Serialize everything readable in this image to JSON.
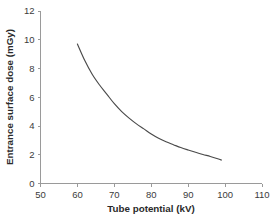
{
  "chart_data": {
    "type": "line",
    "title": "",
    "xlabel": "Tube potential (kV)",
    "ylabel": "Entrance surface dose (mGy)",
    "xlim": [
      50,
      110
    ],
    "ylim": [
      0,
      12
    ],
    "xticks": [
      50,
      60,
      70,
      80,
      90,
      100,
      110
    ],
    "yticks": [
      0,
      2,
      4,
      6,
      8,
      10,
      12
    ],
    "xtick_labels": [
      "50",
      "60",
      "70",
      "80",
      "90",
      "100",
      "110"
    ],
    "ytick_labels": [
      "0",
      "2",
      "4",
      "6",
      "8",
      "10",
      "12"
    ],
    "grid": false,
    "legend": false,
    "markers": false,
    "series": [
      {
        "name": "Entrance surface dose",
        "color": "#4a4a4a",
        "x": [
          60,
          62,
          64,
          66,
          68,
          70,
          72,
          74,
          76,
          78,
          80,
          82,
          84,
          86,
          88,
          90,
          92,
          94,
          96,
          98,
          99
        ],
        "values": [
          9.7,
          8.55,
          7.6,
          6.85,
          6.2,
          5.55,
          5.0,
          4.55,
          4.15,
          3.8,
          3.45,
          3.15,
          2.9,
          2.7,
          2.5,
          2.33,
          2.17,
          2.02,
          1.88,
          1.72,
          1.63
        ]
      }
    ]
  },
  "axis_titles": {
    "x": "Tube potential (kV)",
    "y": "Entrance surface dose (mGy)"
  },
  "caption": {
    "partial_text": ""
  }
}
